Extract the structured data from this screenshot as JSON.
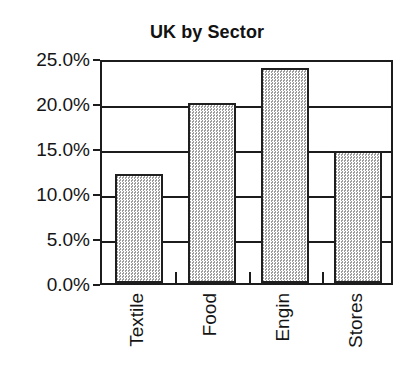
{
  "chart_data": {
    "type": "bar",
    "title": "UK by Sector",
    "xlabel": "",
    "ylabel": "",
    "categories": [
      "Textile",
      "Food",
      "Engin",
      "Stores"
    ],
    "values": [
      12.1,
      20.0,
      23.9,
      14.7
    ],
    "value_unit": "%",
    "ylim": [
      0.0,
      25.0
    ],
    "ytick_values": [
      0.0,
      5.0,
      10.0,
      15.0,
      20.0,
      25.0
    ],
    "ytick_labels": [
      "0.0%",
      "5.0%",
      "10.0%",
      "15.0%",
      "20.0%",
      "25.0%"
    ],
    "grid": true,
    "grid_axis": "y",
    "legend": false,
    "legend_position": "none",
    "bar_fill_color": "#d2d2d2",
    "bar_border_color": "#1f1f1f",
    "axis_color": "#1c1c1c",
    "background_color": "#ffffff",
    "text_color": "#151515",
    "xtick_label_rotation": 90
  }
}
